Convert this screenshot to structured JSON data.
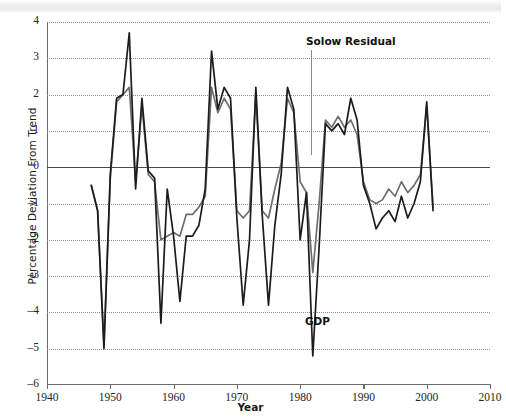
{
  "figure": {
    "title": "",
    "y_axis_title": "Percentage Deviation From Trend",
    "x_axis_title": "Year"
  },
  "annotations": {
    "solow": "Solow Residual",
    "gdp": "GDP"
  },
  "axes": {
    "y_ticks": [
      "4",
      "3",
      "2",
      "1",
      "0",
      "-1",
      "-2",
      "-3",
      "-4",
      "-5",
      "-6"
    ],
    "x_ticks": [
      "1940",
      "1950",
      "1960",
      "1970",
      "1980",
      "1990",
      "2000",
      "2010"
    ]
  },
  "colors": {
    "gdp_line": "#1c1c1c",
    "solow_line": "#6e6e6e",
    "gridline": "#8e8e8e",
    "axis": "#6a6a6a",
    "zero_line": "#4a4a4a"
  },
  "chart_data": {
    "type": "line",
    "title": "",
    "xlabel": "Year",
    "ylabel": "Percentage Deviation From Trend",
    "xlim": [
      1940,
      2010
    ],
    "ylim": [
      -6,
      4
    ],
    "grid": true,
    "legend": "inline-annotations",
    "x": [
      1947,
      1948,
      1949,
      1950,
      1951,
      1952,
      1953,
      1954,
      1955,
      1956,
      1957,
      1958,
      1959,
      1960,
      1961,
      1962,
      1963,
      1964,
      1965,
      1966,
      1967,
      1968,
      1969,
      1970,
      1971,
      1972,
      1973,
      1974,
      1975,
      1976,
      1977,
      1978,
      1979,
      1980,
      1981,
      1982,
      1983,
      1984,
      1985,
      1986,
      1987,
      1988,
      1989,
      1990,
      1991,
      1992,
      1993,
      1994,
      1995,
      1996,
      1997,
      1998,
      1999,
      2000,
      2001
    ],
    "series": [
      {
        "name": "GDP",
        "color": "#1c1c1c",
        "values": [
          -0.5,
          -1.2,
          -5.0,
          -0.2,
          1.9,
          2.0,
          3.7,
          -0.6,
          1.9,
          -0.1,
          -0.3,
          -4.3,
          -0.6,
          -1.9,
          -3.7,
          -1.9,
          -1.9,
          -1.6,
          -0.6,
          3.2,
          1.6,
          2.2,
          1.9,
          -1.4,
          -3.8,
          -2.0,
          2.2,
          -1.3,
          -3.8,
          -1.6,
          -0.2,
          2.2,
          1.6,
          -2.0,
          -0.7,
          -5.2,
          -2.2,
          1.2,
          1.0,
          1.2,
          0.9,
          1.9,
          1.3,
          -0.5,
          -1.0,
          -1.7,
          -1.4,
          -1.2,
          -1.5,
          -0.8,
          -1.4,
          -1.0,
          -0.4,
          1.8,
          -1.2
        ]
      },
      {
        "name": "Solow Residual",
        "color": "#6e6e6e",
        "values": [
          -0.5,
          -1.2,
          -4.9,
          -0.3,
          1.8,
          2.0,
          2.2,
          -0.4,
          1.7,
          -0.2,
          -0.4,
          -2.0,
          -1.9,
          -1.8,
          -1.9,
          -1.3,
          -1.3,
          -1.1,
          -0.8,
          2.2,
          1.5,
          1.9,
          1.6,
          -1.2,
          -1.4,
          -1.2,
          2.0,
          -1.2,
          -1.4,
          -0.6,
          0.1,
          1.9,
          1.5,
          -0.4,
          -0.7,
          -2.9,
          -1.0,
          1.3,
          1.1,
          1.4,
          1.1,
          1.3,
          0.9,
          -0.4,
          -0.9,
          -1.0,
          -0.9,
          -0.6,
          -0.8,
          -0.4,
          -0.7,
          -0.5,
          -0.2,
          1.7,
          -1.1
        ]
      }
    ]
  }
}
